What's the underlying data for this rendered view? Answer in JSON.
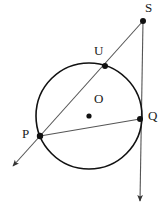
{
  "figure": {
    "background_color": "#ffffff",
    "stroke_color": "#1a1a1a",
    "line_color": "#555555",
    "width": 168,
    "height": 211
  },
  "circle": {
    "name": "circle-O",
    "center_label": "O",
    "cx": 89,
    "cy": 116,
    "r": 53,
    "stroke": "#111111",
    "stroke_width": 1.6
  },
  "points": [
    {
      "id": "S",
      "label": "S",
      "x": 143,
      "y": 21,
      "label_x": 145,
      "label_y": 1,
      "on_circle": false,
      "dot_r": 3.0
    },
    {
      "id": "U",
      "label": "U",
      "x": 105,
      "y": 66,
      "label_x": 94,
      "label_y": 44,
      "on_circle": true,
      "dot_r": 3.0
    },
    {
      "id": "Q",
      "label": "Q",
      "x": 140,
      "y": 119,
      "label_x": 148,
      "label_y": 109,
      "on_circle": true,
      "dot_r": 3.0
    },
    {
      "id": "P",
      "label": "P",
      "x": 40,
      "y": 136,
      "label_x": 22,
      "label_y": 127,
      "on_circle": true,
      "dot_r": 3.2
    },
    {
      "id": "O",
      "label": "O",
      "x": 89,
      "y": 116,
      "label_x": 94,
      "label_y": 92,
      "on_circle": false,
      "dot_r": 2.6
    }
  ],
  "segments": [
    {
      "id": "secant-PS",
      "name": "secant-line-p-u-s",
      "x1": 40,
      "y1": 136,
      "x2": 143,
      "y2": 21,
      "arrow_start": false,
      "arrow_end": false
    },
    {
      "id": "ray-P-down",
      "name": "ray-p-extension",
      "x1": 40,
      "y1": 136,
      "x2": 13,
      "y2": 166,
      "arrow_start": false,
      "arrow_end": true
    },
    {
      "id": "chord-PQ",
      "name": "chord-p-q",
      "x1": 40,
      "y1": 136,
      "x2": 140,
      "y2": 119,
      "arrow_start": false,
      "arrow_end": false
    },
    {
      "id": "tangent-SQ",
      "name": "tangent-line-s-q",
      "x1": 143,
      "y1": 21,
      "x2": 140,
      "y2": 201,
      "arrow_start": false,
      "arrow_end": true
    }
  ],
  "labels": {
    "S": "S",
    "U": "U",
    "P": "P",
    "Q": "Q",
    "O": "O"
  }
}
